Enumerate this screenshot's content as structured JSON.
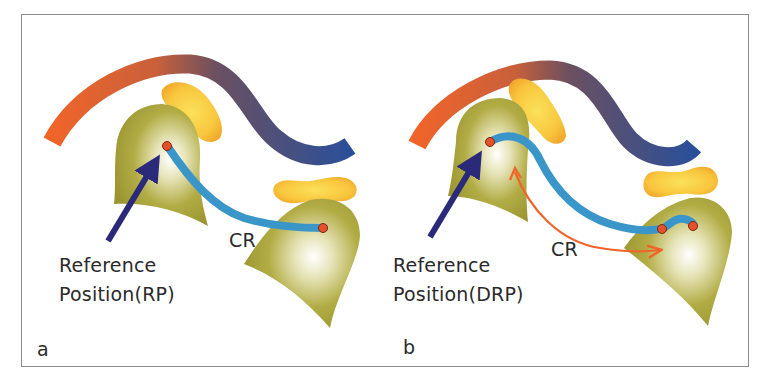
{
  "figure": {
    "panels": [
      {
        "id": "a",
        "letter": "a",
        "reference_label_line1": "Reference",
        "reference_label_line2": "Position(RP)",
        "arc_label": "CR"
      },
      {
        "id": "b",
        "letter": "b",
        "reference_label_line1": "Reference",
        "reference_label_line2": "Position(DRP)",
        "arc_label": "CR"
      }
    ],
    "colors": {
      "frame_border": "#8d8d8d",
      "arch_orange": "#f0642a",
      "arch_brown": "#6b5060",
      "arch_blue": "#2e4f95",
      "condyle_olive": "#a6a035",
      "disc_yellow": "#f7c23c",
      "path_blue": "#3a95c8",
      "point_red": "#e8502a",
      "arrow_navy": "#2b2a7a",
      "cr_arrow_orange": "#f0642a"
    }
  }
}
